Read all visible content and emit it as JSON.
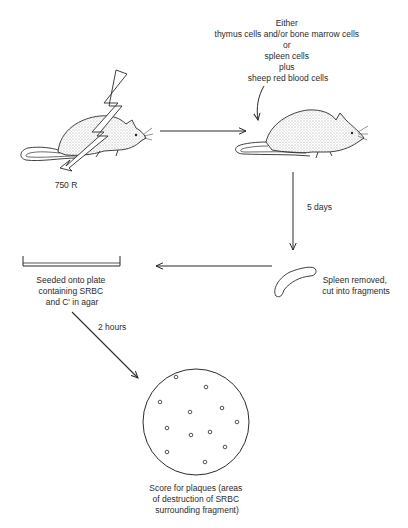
{
  "diagram": {
    "steps": [
      {
        "id": "irradiated-mouse",
        "label": "750 R"
      },
      {
        "id": "injected-mouse",
        "label_lines": [
          "Either",
          "thymus cells and/or bone marrow cells",
          "or",
          "spleen cells",
          "plus",
          "sheep red blood cells"
        ]
      },
      {
        "id": "spleen",
        "label_lines": [
          "Spleen removed,",
          "cut into fragments"
        ]
      },
      {
        "id": "plate",
        "label_lines": [
          "Seeded onto plate",
          "containing SRBC",
          "and C' in agar"
        ]
      },
      {
        "id": "petri-dish",
        "label_lines": [
          "Score for plaques (areas",
          "of destruction of SRBC",
          "surrounding fragment)"
        ]
      }
    ],
    "arrows": [
      {
        "from": "irradiated-mouse",
        "to": "injected-mouse",
        "label": ""
      },
      {
        "from": "injected-mouse",
        "to": "spleen",
        "label": "5 days"
      },
      {
        "from": "spleen",
        "to": "plate",
        "label": ""
      },
      {
        "from": "plate",
        "to": "petri-dish",
        "label": "2 hours"
      }
    ],
    "plaque_count": 12,
    "colors": {
      "ink": "#2b2b2b",
      "background": "#ffffff"
    }
  }
}
